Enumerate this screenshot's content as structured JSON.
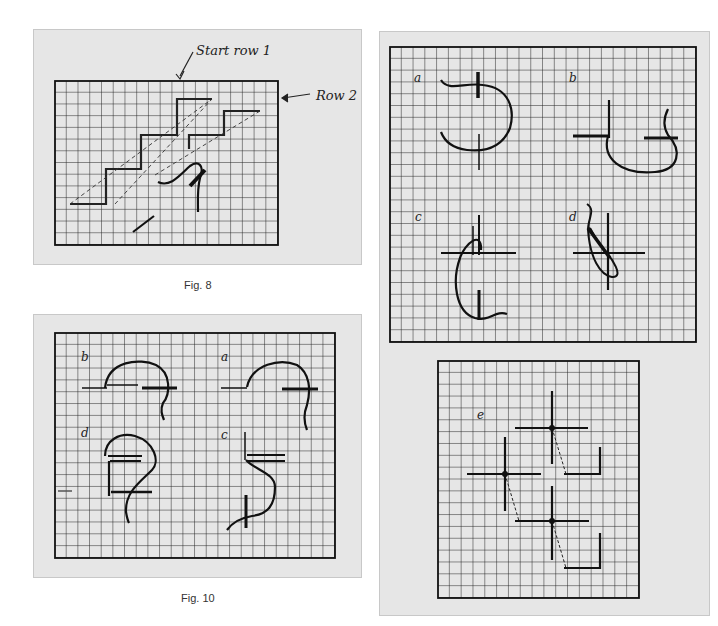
{
  "figures": [
    {
      "id": "fig8",
      "caption": "Fig. 8",
      "annotations": {
        "start_row": "Start row 1",
        "row2": "Row 2"
      }
    },
    {
      "id": "fig10",
      "caption": "Fig. 10",
      "labels": [
        "b",
        "a",
        "d",
        "c"
      ]
    },
    {
      "id": "right-top",
      "labels": [
        "a",
        "b",
        "c",
        "d"
      ]
    },
    {
      "id": "right-bottom",
      "labels": [
        "e"
      ]
    }
  ],
  "colors": {
    "panel_bg": "#e6e6e6",
    "grid": "#1a1a1a",
    "page_bg": "#ffffff"
  }
}
